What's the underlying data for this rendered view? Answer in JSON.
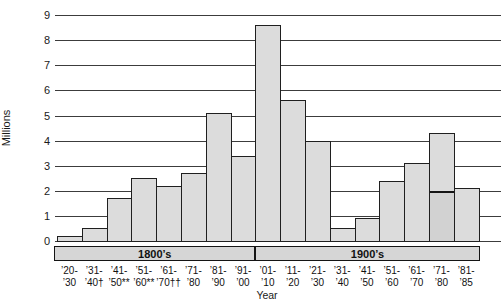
{
  "chart_data": {
    "type": "bar",
    "title": "",
    "ylabel": "Millions",
    "xlabel": "Year",
    "ylim": [
      0,
      9
    ],
    "yticks": [
      0,
      1,
      2,
      3,
      4,
      5,
      6,
      7,
      8,
      9
    ],
    "grid": true,
    "legend": "none",
    "bar_color": "#dcdcdc",
    "bar_border_color": "#1f1f1f",
    "categories": [
      "’20-’30",
      "’31-’40†",
      "’41-’50**",
      "’51-’60**",
      "’61-’70††",
      "’71-’80",
      "’81-’90",
      "’91-’00",
      "’01-’10",
      "’11-’20",
      "’21-’30",
      "’31-’40",
      "’41-’50",
      "’51-’60",
      "’61-’70",
      "’71-’80",
      "’81-’85"
    ],
    "tick_label_lines": [
      [
        "’20-",
        "’30"
      ],
      [
        "’31-",
        "’40†"
      ],
      [
        "’41-",
        "’50**"
      ],
      [
        "’51-",
        "’60**"
      ],
      [
        "’61-",
        "’70††"
      ],
      [
        "’71-",
        "’80"
      ],
      [
        "’81-",
        "’90"
      ],
      [
        "’91-",
        "’00"
      ],
      [
        "’01-",
        "’10"
      ],
      [
        "’11-",
        "’20"
      ],
      [
        "’21-",
        "’30"
      ],
      [
        "’31-",
        "’40"
      ],
      [
        "’41-",
        "’50"
      ],
      [
        "’51-",
        "’60"
      ],
      [
        "’61-",
        "’70"
      ],
      [
        "’71-",
        "’80"
      ],
      [
        "’81-",
        "’85"
      ]
    ],
    "values": [
      0.2,
      0.5,
      1.7,
      2.5,
      2.2,
      2.7,
      5.1,
      3.4,
      8.6,
      5.6,
      4.0,
      0.5,
      0.9,
      2.4,
      3.1,
      4.3,
      2.1
    ],
    "annotations": [
      {
        "type": "segment-divider-line",
        "bar_index": 15,
        "category": "’71-’80",
        "value": 2.0
      }
    ],
    "era_bands": [
      {
        "label": "1800’s",
        "from_index": 0,
        "to_index": 7
      },
      {
        "label": "1900’s",
        "from_index": 8,
        "to_index": 16
      }
    ]
  }
}
